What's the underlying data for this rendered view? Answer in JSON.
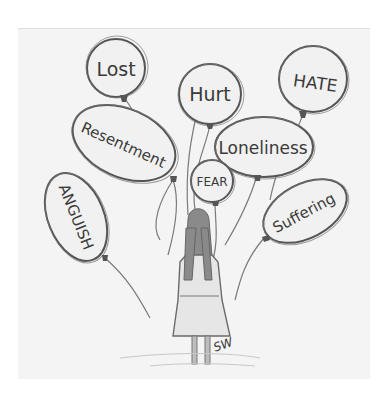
{
  "artwork": {
    "description": "Pencil sketch of a girl seen from behind holding many balloons labeled with negative emotions",
    "colors": {
      "background": "#ffffff",
      "paper": "#f4f4f4",
      "pencil": "#555555"
    },
    "balloons": [
      {
        "id": "lost",
        "label": "Lost"
      },
      {
        "id": "hurt",
        "label": "Hurt"
      },
      {
        "id": "hate",
        "label": "HATE"
      },
      {
        "id": "resentment",
        "label": "Resentment"
      },
      {
        "id": "loneliness",
        "label": "Loneliness"
      },
      {
        "id": "fear",
        "label": "FEAR"
      },
      {
        "id": "anguish",
        "label": "ANGUISH"
      },
      {
        "id": "suffering",
        "label": "Suffering"
      }
    ],
    "signature": "SW"
  }
}
